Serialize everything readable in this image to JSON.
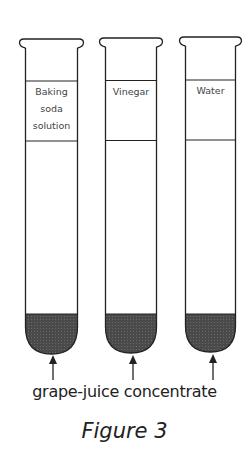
{
  "figure": {
    "title": "Figure 3",
    "caption": "grape-juice concentrate",
    "liquid_color": "#555555",
    "tubes": [
      {
        "label_lines": [
          "Baking",
          "soda",
          "solution"
        ],
        "contents": "grape-juice concentrate"
      },
      {
        "label_lines": [
          "Vinegar"
        ],
        "contents": "grape-juice concentrate"
      },
      {
        "label_lines": [
          "Water"
        ],
        "contents": "grape-juice concentrate"
      }
    ]
  }
}
